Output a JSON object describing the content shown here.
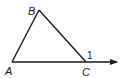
{
  "diagram": {
    "type": "triangle-exterior-angle",
    "vertices": {
      "A": {
        "label": "A",
        "x": 12,
        "y": 62
      },
      "B": {
        "label": "B",
        "x": 39,
        "y": 10
      },
      "C": {
        "label": "C",
        "x": 86,
        "y": 62
      }
    },
    "ray": {
      "from": "A",
      "through": "C",
      "tip_x": 117,
      "tip_y": 62
    },
    "angle_label": "1",
    "stroke_color": "#1a1a1a"
  }
}
